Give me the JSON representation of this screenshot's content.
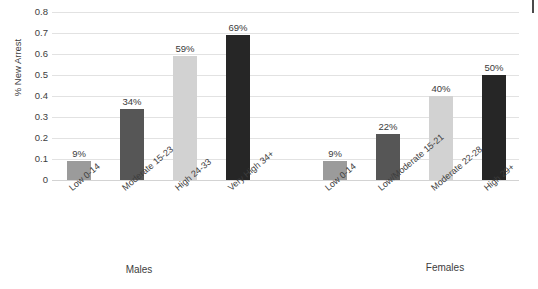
{
  "chart_data": {
    "type": "bar",
    "title": "",
    "subtitle": "",
    "xlabel": "",
    "ylabel": "% New Arrest",
    "ylim": [
      0,
      0.8
    ],
    "ytick_labels": [
      "0.8",
      "0.7",
      "0.6",
      "0.5",
      "0.4",
      "0.3",
      "0.2",
      "0.1",
      "0"
    ],
    "ytick_values": [
      0.8,
      0.7,
      0.6,
      0.5,
      0.4,
      0.3,
      0.2,
      0.1,
      0
    ],
    "grid": true,
    "legend": "none",
    "groups": [
      {
        "name": "Males",
        "label": "Males",
        "categories": [
          "Low 0-14",
          "Moderate 15-23",
          "High 24-33",
          "Very High 34+"
        ],
        "values": [
          0.09,
          0.34,
          0.59,
          0.69
        ],
        "value_labels": [
          "9%",
          "34%",
          "59%",
          "69%"
        ],
        "colors": [
          "#9b9b9b",
          "#565656",
          "#d2d2d2",
          "#262626"
        ]
      },
      {
        "name": "Females",
        "label": "Females",
        "categories": [
          "Low 0-14",
          "Low/Moderate 15-21",
          "Moderate 22-28",
          "High 29+"
        ],
        "values": [
          0.09,
          0.22,
          0.4,
          0.5
        ],
        "value_labels": [
          "9%",
          "22%",
          "40%",
          "50%"
        ],
        "colors": [
          "#9b9b9b",
          "#565656",
          "#d2d2d2",
          "#262626"
        ]
      }
    ]
  },
  "axis": {
    "y_title": "% New Arrest"
  },
  "groups_footer": {
    "males": "Males",
    "females": "Females"
  }
}
